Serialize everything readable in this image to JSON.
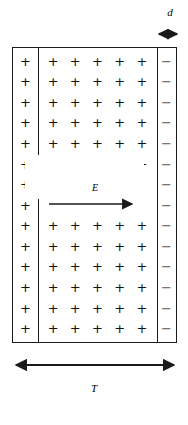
{
  "figure": {
    "labels": {
      "d": "d",
      "E": "E",
      "T": "T"
    },
    "symbols": {
      "positive": "+",
      "negative": "−"
    },
    "colors": {
      "outline": "#1a1a1a",
      "positive": "#111111",
      "negative": "#555555",
      "background": "#ffffff",
      "arrow": "#1a1a1a"
    },
    "left_column": {
      "name": "left-positive-strip",
      "charge": "+",
      "count": 14
    },
    "right_column": {
      "name": "right-negative-strip",
      "charge": "−",
      "count": 14
    },
    "grid": {
      "name": "bulk-positive-charge-grid",
      "charge": "+",
      "columns": 5,
      "rows": 14,
      "gap_rows": [
        6,
        7
      ]
    },
    "field_arrow": {
      "name": "electric-field-arrow",
      "direction": "right",
      "label": "E"
    },
    "thickness_arrow": {
      "name": "depletion-width-arrow",
      "direction": "both",
      "label": "d"
    },
    "total_arrow": {
      "name": "total-thickness-arrow",
      "direction": "both",
      "label": "T"
    }
  }
}
